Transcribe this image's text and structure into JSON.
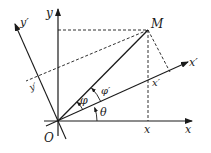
{
  "diagram": {
    "labels": {
      "y_axis": "y",
      "x_axis": "x",
      "y_prime_axis": "y′",
      "x_prime_axis": "x′",
      "point": "M",
      "origin": "O",
      "x_proj": "x",
      "x_prime_proj": "x′",
      "y_prime_proj": "y′",
      "theta": "θ",
      "phi": "φ",
      "phi_prime": "φ′"
    },
    "colors": {
      "line": "#1a1a1a",
      "background": "#ffffff"
    }
  }
}
